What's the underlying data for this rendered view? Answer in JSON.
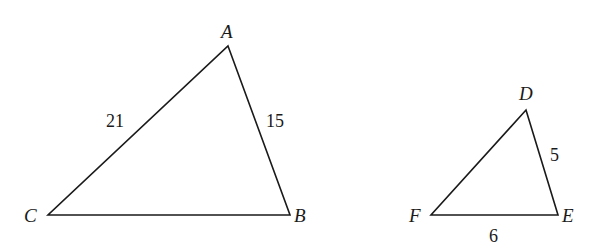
{
  "figure": {
    "type": "similar-triangles",
    "triangles": [
      {
        "name": "triangle-ABC",
        "vertices": {
          "A": {
            "label": "A",
            "x": 228,
            "y": 46
          },
          "B": {
            "label": "B",
            "x": 290,
            "y": 215
          },
          "C": {
            "label": "C",
            "x": 48,
            "y": 215
          }
        },
        "side_labels": {
          "AC": "21",
          "AB": "15"
        }
      },
      {
        "name": "triangle-DEF",
        "vertices": {
          "D": {
            "label": "D",
            "x": 526,
            "y": 110
          },
          "E": {
            "label": "E",
            "x": 558,
            "y": 215
          },
          "F": {
            "label": "F",
            "x": 431,
            "y": 215
          }
        },
        "side_labels": {
          "DE": "5",
          "FE": "6"
        }
      }
    ],
    "colors": {
      "stroke": "#1a1a1a",
      "background": "#ffffff"
    }
  }
}
